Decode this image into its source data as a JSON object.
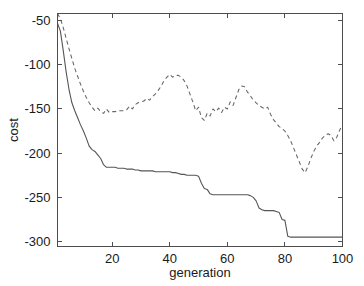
{
  "chart_data": {
    "type": "line",
    "title": "",
    "xlabel": "generation",
    "ylabel": "cost",
    "xlim": [
      1,
      100
    ],
    "ylim": [
      -305,
      -42
    ],
    "grid": false,
    "legend": "none",
    "xticks": [
      20,
      40,
      60,
      80,
      100
    ],
    "xtick_labels": [
      "20",
      "40",
      "60",
      "80",
      "100"
    ],
    "yticks": [
      -50,
      -100,
      -150,
      -200,
      -250,
      -300
    ],
    "ytick_labels": [
      "-50",
      "-100",
      "-150",
      "-200",
      "-250",
      "-300"
    ],
    "series": [
      {
        "name": "best cost",
        "style": "solid",
        "color": "#555555",
        "x": [
          1,
          2,
          3,
          4,
          5,
          6,
          7,
          8,
          9,
          10,
          11,
          12,
          13,
          14,
          15,
          16,
          17,
          18,
          19,
          20,
          21,
          22,
          23,
          24,
          25,
          26,
          27,
          28,
          29,
          30,
          31,
          32,
          33,
          34,
          35,
          36,
          37,
          38,
          39,
          40,
          41,
          42,
          43,
          44,
          45,
          46,
          47,
          48,
          49,
          50,
          51,
          52,
          53,
          54,
          55,
          56,
          57,
          58,
          59,
          60,
          61,
          62,
          63,
          64,
          65,
          66,
          67,
          68,
          69,
          70,
          71,
          72,
          73,
          74,
          75,
          76,
          77,
          78,
          79,
          80,
          81,
          82,
          83,
          84,
          85,
          86,
          87,
          88,
          89,
          90,
          91,
          92,
          93,
          94,
          95,
          96,
          97,
          98,
          99,
          100
        ],
        "y": [
          -53,
          -62,
          -84,
          -108,
          -128,
          -143,
          -152,
          -160,
          -168,
          -175,
          -183,
          -192,
          -196,
          -198,
          -202,
          -206,
          -213,
          -216,
          -216,
          -216,
          -216,
          -217,
          -217,
          -217,
          -218,
          -218,
          -218,
          -219,
          -219,
          -220,
          -220,
          -220,
          -220,
          -220,
          -221,
          -221,
          -221,
          -221,
          -221,
          -221,
          -222,
          -222,
          -223,
          -224,
          -224,
          -225,
          -225,
          -225,
          -225,
          -226,
          -234,
          -240,
          -241,
          -246,
          -247,
          -247,
          -247,
          -247,
          -247,
          -247,
          -247,
          -247,
          -247,
          -247,
          -247,
          -247,
          -247,
          -248,
          -250,
          -254,
          -262,
          -264,
          -265,
          -265,
          -265,
          -265,
          -266,
          -267,
          -275,
          -276,
          -294,
          -295,
          -295,
          -295,
          -295,
          -295,
          -295,
          -295,
          -295,
          -295,
          -295,
          -295,
          -295,
          -295,
          -295,
          -295,
          -295,
          -295,
          -295,
          -295
        ]
      },
      {
        "name": "mean cost",
        "style": "dashed",
        "color": "#666666",
        "x": [
          1,
          2,
          3,
          4,
          5,
          6,
          7,
          8,
          9,
          10,
          11,
          12,
          13,
          14,
          15,
          16,
          17,
          18,
          19,
          20,
          21,
          22,
          23,
          24,
          25,
          26,
          27,
          28,
          29,
          30,
          31,
          32,
          33,
          34,
          35,
          36,
          37,
          38,
          39,
          40,
          41,
          42,
          43,
          44,
          45,
          46,
          47,
          48,
          49,
          50,
          51,
          52,
          53,
          54,
          55,
          56,
          57,
          58,
          59,
          60,
          61,
          62,
          63,
          64,
          65,
          66,
          67,
          68,
          69,
          70,
          71,
          72,
          73,
          74,
          75,
          76,
          77,
          78,
          79,
          80,
          81,
          82,
          83,
          84,
          85,
          86,
          87,
          88,
          89,
          90,
          91,
          92,
          93,
          94,
          95,
          96,
          97,
          98,
          99,
          100
        ],
        "y": [
          -42,
          -48,
          -58,
          -70,
          -82,
          -93,
          -104,
          -113,
          -122,
          -130,
          -137,
          -143,
          -148,
          -152,
          -149,
          -153,
          -155,
          -150,
          -154,
          -153,
          -153,
          -152,
          -152,
          -152,
          -151,
          -147,
          -150,
          -145,
          -143,
          -142,
          -141,
          -138,
          -140,
          -136,
          -133,
          -129,
          -124,
          -118,
          -114,
          -111,
          -114,
          -112,
          -112,
          -114,
          -118,
          -124,
          -133,
          -142,
          -152,
          -148,
          -160,
          -163,
          -155,
          -158,
          -150,
          -153,
          -149,
          -154,
          -148,
          -150,
          -142,
          -146,
          -137,
          -128,
          -124,
          -125,
          -131,
          -135,
          -140,
          -143,
          -146,
          -148,
          -150,
          -148,
          -156,
          -162,
          -166,
          -170,
          -172,
          -175,
          -180,
          -186,
          -194,
          -202,
          -210,
          -218,
          -222,
          -215,
          -206,
          -198,
          -192,
          -188,
          -183,
          -180,
          -178,
          -180,
          -186,
          -182,
          -174,
          -168
        ]
      }
    ]
  },
  "axes": {
    "ylabel_text": "cost",
    "xlabel_text": "generation"
  }
}
